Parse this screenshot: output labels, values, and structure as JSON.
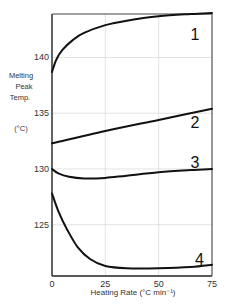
{
  "chart_data": {
    "type": "line",
    "title": "",
    "xlabel": "Heating Rate (°C min⁻¹)",
    "ylabel": "Melting Peak Temp. (°C)",
    "ylabel_lines": [
      "Melting",
      "Peak",
      "Temp.",
      "(°C)"
    ],
    "xlim": [
      0,
      75
    ],
    "ylim": [
      120.4,
      143.9
    ],
    "x_ticks": [
      0,
      25,
      50,
      75
    ],
    "x_tick_labels": [
      "0",
      "25",
      "50",
      "75"
    ],
    "y_ticks": [
      125,
      130,
      135,
      140
    ],
    "y_tick_labels": [
      "125",
      "130",
      "135",
      "140"
    ],
    "grid": true,
    "legend": "none (curves labeled directly 1–4)",
    "series": [
      {
        "name": "1",
        "label_at": [
          38,
          142.1
        ],
        "x": [
          0,
          2,
          5,
          10,
          15,
          25,
          35,
          50,
          65,
          75
        ],
        "values": [
          138.7,
          139.8,
          140.7,
          141.6,
          142.2,
          142.9,
          143.3,
          143.7,
          143.9,
          144.0
        ]
      },
      {
        "name": "2",
        "label_at": [
          38,
          134.2
        ],
        "x": [
          0,
          25,
          50,
          75
        ],
        "values": [
          132.3,
          133.4,
          134.4,
          135.4
        ]
      },
      {
        "name": "3",
        "label_at": [
          38,
          130.6
        ],
        "x": [
          0,
          3,
          8,
          15,
          25,
          35,
          50,
          65,
          75
        ],
        "values": [
          130.0,
          129.6,
          129.3,
          129.15,
          129.2,
          129.4,
          129.7,
          129.9,
          130.0
        ]
      },
      {
        "name": "4",
        "label_at": [
          40,
          121.9
        ],
        "x": [
          0,
          3,
          7,
          12,
          18,
          25,
          35,
          50,
          65,
          75
        ],
        "values": [
          127.8,
          126.2,
          124.6,
          123.0,
          121.9,
          121.3,
          121.1,
          121.1,
          121.2,
          121.4
        ]
      }
    ]
  }
}
